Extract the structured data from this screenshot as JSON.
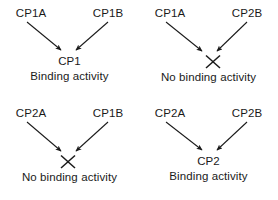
{
  "figure": {
    "name": "binding-activity-combinations",
    "background": "#ffffff",
    "ink": "#1a1a1a"
  },
  "panels": [
    {
      "id": "top-left",
      "parent_left": "CP1A",
      "parent_right": "CP1B",
      "outcome": "binding",
      "product": "CP1",
      "caption": "Binding activity",
      "has_cross": false
    },
    {
      "id": "top-right",
      "parent_left": "CP1A",
      "parent_right": "CP2B",
      "outcome": "no-binding",
      "product": "",
      "caption": "No binding activity",
      "has_cross": true
    },
    {
      "id": "bottom-left",
      "parent_left": "CP2A",
      "parent_right": "CP1B",
      "outcome": "no-binding",
      "product": "",
      "caption": "No binding activity",
      "has_cross": true
    },
    {
      "id": "bottom-right",
      "parent_left": "CP2A",
      "parent_right": "CP2B",
      "outcome": "binding",
      "product": "CP2",
      "caption": "Binding activity",
      "has_cross": false
    }
  ]
}
